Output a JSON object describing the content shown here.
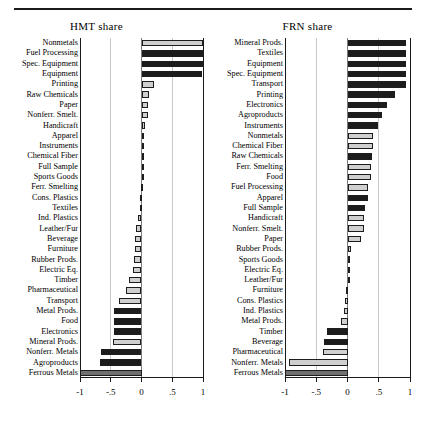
{
  "figure": {
    "panels": [
      "HMT share",
      "FRN share"
    ]
  },
  "chart_data": [
    {
      "type": "bar",
      "title": "HMT share",
      "orientation": "horizontal",
      "xlabel": "",
      "ylabel": "",
      "xlim": [
        -1,
        1
      ],
      "xticks": [
        -1,
        -0.5,
        0,
        0.5,
        1
      ],
      "xticklabels": [
        "-1",
        "-.5",
        "0",
        ".5",
        "1"
      ],
      "grid": true,
      "legend": "none",
      "categories": [
        "Nonmetals",
        "Fuel Processing",
        "Spec. Equipment",
        "Equipment",
        "Printing",
        "Raw Chemicals",
        "Paper",
        "Nonferr. Smelt.",
        "Handicraft",
        "Apparel",
        "Instruments",
        "Chemical Fiber",
        "Full Sample",
        "Sports Goods",
        "Ferr. Smelting",
        "Cons. Plastics",
        "Textiles",
        "Ind. Plastics",
        "Leather/Fur",
        "Beverage",
        "Furniture",
        "Rubber Prods.",
        "Electric Eq.",
        "Timber",
        "Pharmaceutical",
        "Transport",
        "Metal Prods.",
        "Food",
        "Electronics",
        "Mineral Prods.",
        "Nonferr. Metals",
        "Agroproducts",
        "Ferrous Metals"
      ],
      "values": [
        1.0,
        1.0,
        1.02,
        0.98,
        0.2,
        0.13,
        0.11,
        0.1,
        0.05,
        0.04,
        0.03,
        0.01,
        0.01,
        0.01,
        -0.01,
        -0.02,
        -0.03,
        -0.05,
        -0.09,
        -0.1,
        -0.11,
        -0.12,
        -0.14,
        -0.2,
        -0.26,
        -0.36,
        -0.44,
        -0.45,
        -0.45,
        -0.47,
        -0.66,
        -0.67,
        -1.0
      ],
      "shades": [
        "light",
        "dark",
        "dark",
        "dark",
        "light",
        "light",
        "light",
        "light",
        "light",
        "light",
        "light",
        "light",
        "dark",
        "light",
        "light",
        "light",
        "light",
        "light",
        "light",
        "light",
        "light",
        "light",
        "light",
        "light",
        "light",
        "light",
        "dark",
        "dark",
        "dark",
        "light",
        "dark",
        "dark",
        "mid"
      ]
    },
    {
      "type": "bar",
      "title": "FRN share",
      "orientation": "horizontal",
      "xlabel": "",
      "ylabel": "",
      "xlim": [
        -1,
        1
      ],
      "xticks": [
        -1,
        -0.5,
        0,
        0.5,
        1
      ],
      "xticklabels": [
        "-1",
        "-.5",
        "0",
        ".5",
        "1"
      ],
      "grid": true,
      "legend": "none",
      "categories": [
        "Mineral Prods.",
        "Textiles",
        "Equipment",
        "Spec. Equipment",
        "Transport",
        "Printing",
        "Electronics",
        "Agroproducts",
        "Instruments",
        "Nonmetals",
        "Chemical Fiber",
        "Raw Chemicals",
        "Ferr. Smelting",
        "Food",
        "Fuel Processing",
        "Apparel",
        "Full Sample",
        "Handicraft",
        "Nonferr. Smelt.",
        "Paper",
        "Rubber Prods.",
        "Sports Goods",
        "Electric Eq.",
        "Leather/Fur",
        "Furniture",
        "Cons. Plastics",
        "Ind. Plastics",
        "Metal Prods.",
        "Timber",
        "Beverage",
        "Pharmaceutical",
        "Nonferr. Metals",
        "Ferrous Metals"
      ],
      "values": [
        0.93,
        0.93,
        0.93,
        0.93,
        0.93,
        0.76,
        0.63,
        0.55,
        0.49,
        0.4,
        0.4,
        0.39,
        0.38,
        0.37,
        0.33,
        0.32,
        0.28,
        0.27,
        0.26,
        0.21,
        0.06,
        0.04,
        0.01,
        0.0,
        -0.03,
        -0.04,
        -0.06,
        -0.1,
        -0.33,
        -0.37,
        -0.4,
        -0.93,
        -1.0
      ],
      "shades": [
        "dark",
        "dark",
        "dark",
        "dark",
        "dark",
        "dark",
        "dark",
        "dark",
        "dark",
        "light",
        "light",
        "dark",
        "light",
        "light",
        "light",
        "dark",
        "dark",
        "light",
        "light",
        "light",
        "light",
        "light",
        "light",
        "light",
        "light",
        "light",
        "light",
        "light",
        "dark",
        "dark",
        "light",
        "light",
        "mid"
      ]
    }
  ]
}
